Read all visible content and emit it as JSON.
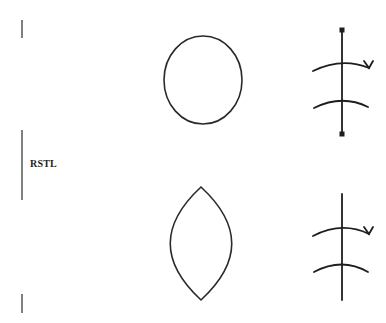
{
  "diagram": {
    "rstl_label": "RSTL",
    "colors": {
      "stroke": "#2a2a2a",
      "background": "#ffffff"
    },
    "rows": [
      {
        "shape": "ellipse",
        "symbol": "suture-line-with-end-dots"
      },
      {
        "shape": "lens",
        "symbol": "suture-line"
      }
    ]
  }
}
